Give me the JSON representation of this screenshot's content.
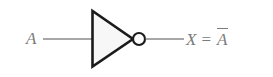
{
  "figure": {
    "kind": "logic-gate-diagram",
    "gate_type": "NOT",
    "gate_alias": "inverter",
    "background_color": "#ffffff"
  },
  "input": {
    "label": "A",
    "wire_color": "#8a8a8a",
    "label_color": "#7b7b7b"
  },
  "gate": {
    "body_shape": "triangle",
    "body_fill": "#f7f7f7",
    "body_stroke": "#1b1b1b",
    "bubble_shape": "circle",
    "bubble_fill": "#ffffff",
    "bubble_stroke": "#1b1b1b"
  },
  "output": {
    "variable": "X",
    "equals": "=",
    "expression_base": "A",
    "expression_bar": true,
    "full_text": "X = Ā",
    "wire_color": "#8a8a8a",
    "label_color": "#7b7b7b"
  }
}
